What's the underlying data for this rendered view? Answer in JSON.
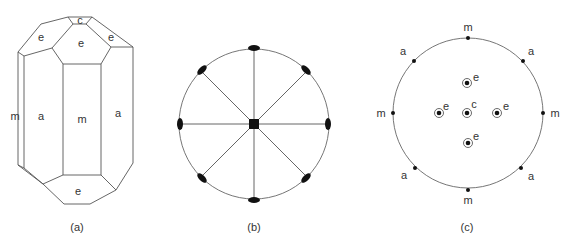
{
  "figure": {
    "panels": [
      {
        "id": "a",
        "caption": "(a)",
        "description": "Crystal drawing with labeled faces",
        "faces": {
          "c_top": "c",
          "e_top_left": "e",
          "e_top_center": "e",
          "e_top_right": "e",
          "m_left": "m",
          "a_left": "a",
          "m_center": "m",
          "a_right": "a",
          "e_bottom": "e"
        }
      },
      {
        "id": "b",
        "caption": "(b)",
        "description": "Stereographic symmetry diagram: 4-fold axis at center (square), 8 two-fold axes (ellipses) on primitive circle with mirror lines"
      },
      {
        "id": "c",
        "caption": "(c)",
        "description": "Stereographic projection of face poles",
        "poles": {
          "m_top": "m",
          "m_left": "m",
          "m_right": "m",
          "m_bottom": "m",
          "a_top_left": "a",
          "a_top_right": "a",
          "a_bottom_left": "a",
          "a_bottom_right": "a",
          "c_center": "c",
          "e_top": "e",
          "e_left": "e",
          "e_right": "e",
          "e_bottom": "e"
        }
      }
    ]
  }
}
